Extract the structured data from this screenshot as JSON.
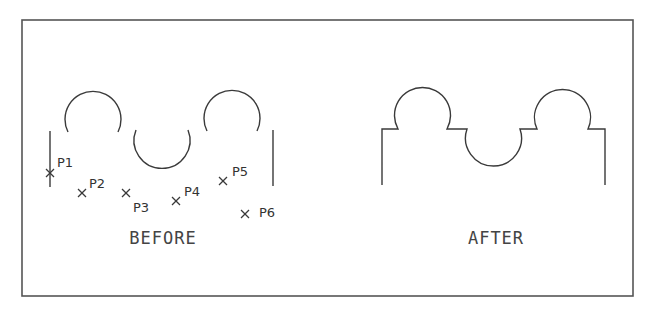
{
  "figure": {
    "frame": {
      "x": 22,
      "y": 20,
      "width": 611,
      "height": 276,
      "color": "#555555"
    },
    "before": {
      "caption": "BEFORE",
      "points": [
        {
          "label": "P1",
          "x": 50,
          "y": 173
        },
        {
          "label": "P2",
          "x": 82,
          "y": 193
        },
        {
          "label": "P3",
          "x": 126,
          "y": 193
        },
        {
          "label": "P4",
          "x": 176,
          "y": 201
        },
        {
          "label": "P5",
          "x": 223,
          "y": 181
        },
        {
          "label": "P6",
          "x": 245,
          "y": 214
        }
      ]
    },
    "after": {
      "caption": "AFTER"
    }
  }
}
